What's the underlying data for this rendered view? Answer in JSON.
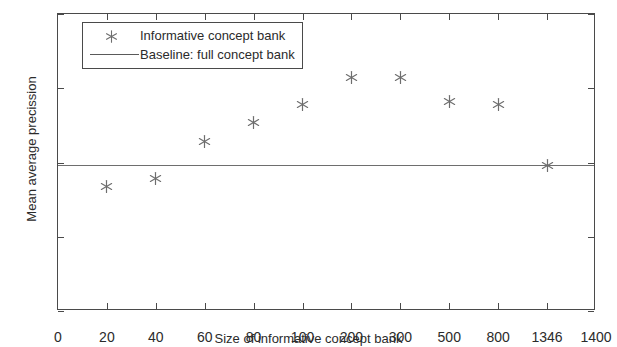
{
  "chart_data": {
    "type": "scatter",
    "title": "",
    "xlabel": "Size of informative concept bank",
    "ylabel": "Mean average precission",
    "categories": [
      "0",
      "20",
      "40",
      "60",
      "80",
      "100",
      "200",
      "300",
      "500",
      "800",
      "1346",
      "1400"
    ],
    "xtick_labels": [
      "0",
      "20",
      "40",
      "60",
      "80",
      "100",
      "200",
      "300",
      "500",
      "800",
      "1346",
      "1400"
    ],
    "ytick_labels": [
      "0",
      "0.05",
      "0.1",
      "0.15",
      "0.2"
    ],
    "ytick_values": [
      0,
      0.05,
      0.1,
      0.15,
      0.2
    ],
    "ylim": [
      0,
      0.2
    ],
    "grid": false,
    "legend_position": "top-left",
    "axis_scale_note": "x tick labels are evenly spaced (categorical spacing), not linear",
    "series": [
      {
        "name": "Informative concept bank",
        "marker": "asterisk",
        "color": "#6e6e6e",
        "x": [
          20,
          40,
          60,
          80,
          100,
          200,
          300,
          500,
          800,
          1346
        ],
        "x_slots": [
          1,
          2,
          3,
          4,
          5,
          6,
          7,
          8,
          9,
          10
        ],
        "values": [
          0.084,
          0.089,
          0.114,
          0.127,
          0.139,
          0.157,
          0.157,
          0.141,
          0.139,
          0.098
        ]
      },
      {
        "name": "Baseline: full concept bank",
        "marker": "line",
        "color": "#6e6e6e",
        "constant_value": 0.098
      }
    ]
  },
  "legend": {
    "items": [
      {
        "label": "Informative concept bank",
        "key": "asterisk-marker"
      },
      {
        "label": "Baseline: full concept bank",
        "key": "line-swatch"
      }
    ]
  },
  "colors": {
    "axis": "#4a4a4a",
    "marker": "#6e6e6e",
    "baseline": "#6e6e6e",
    "text": "#2b2b2b",
    "background": "#ffffff"
  }
}
